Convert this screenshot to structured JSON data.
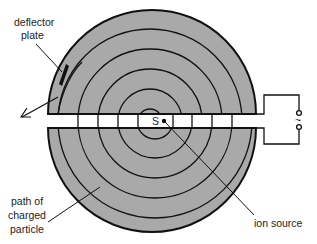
{
  "figure": {
    "labels": {
      "deflector_line1": "deflector",
      "deflector_line2": "plate",
      "path_line1": "path of",
      "path_line2": "charged",
      "path_line3": "particle",
      "ion_source": "ion source",
      "source_marker": "S",
      "ac_symbol": "~"
    },
    "colors": {
      "dee_fill": "#a9a9a9",
      "outline": "#111111",
      "gap": "#ffffff"
    }
  }
}
